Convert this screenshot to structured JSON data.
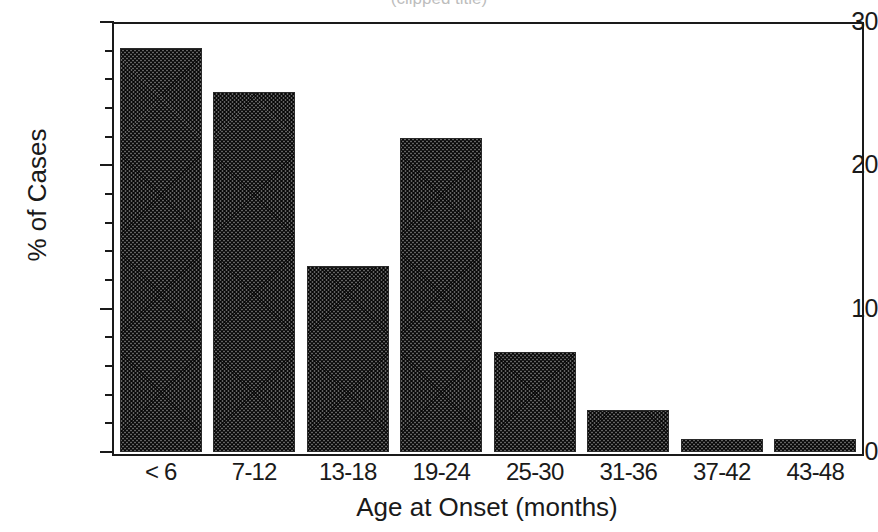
{
  "chart_data": {
    "type": "bar",
    "title": "",
    "xlabel": "Age at Onset (months)",
    "ylabel": "% of Cases",
    "categories": [
      "< 6",
      "7-12",
      "13-18",
      "19-24",
      "25-30",
      "31-36",
      "37-42",
      "43-48"
    ],
    "values": [
      28.2,
      25.1,
      13.0,
      21.9,
      7.0,
      2.9,
      0.9,
      0.9
    ],
    "ylim": [
      0,
      30
    ],
    "ytick_labels": [
      "0",
      "10",
      "20",
      "30"
    ],
    "ytick_values": [
      0,
      10,
      20,
      30
    ],
    "yminor_step": 2,
    "grid": false,
    "legend": null,
    "bar_fill": "#7d7d7d",
    "bar_edge": "#2a2a2a",
    "axis_color": "#1a1a1a",
    "background": "#ffffff"
  },
  "figure": {
    "title_clipped": "(clipped title)"
  }
}
